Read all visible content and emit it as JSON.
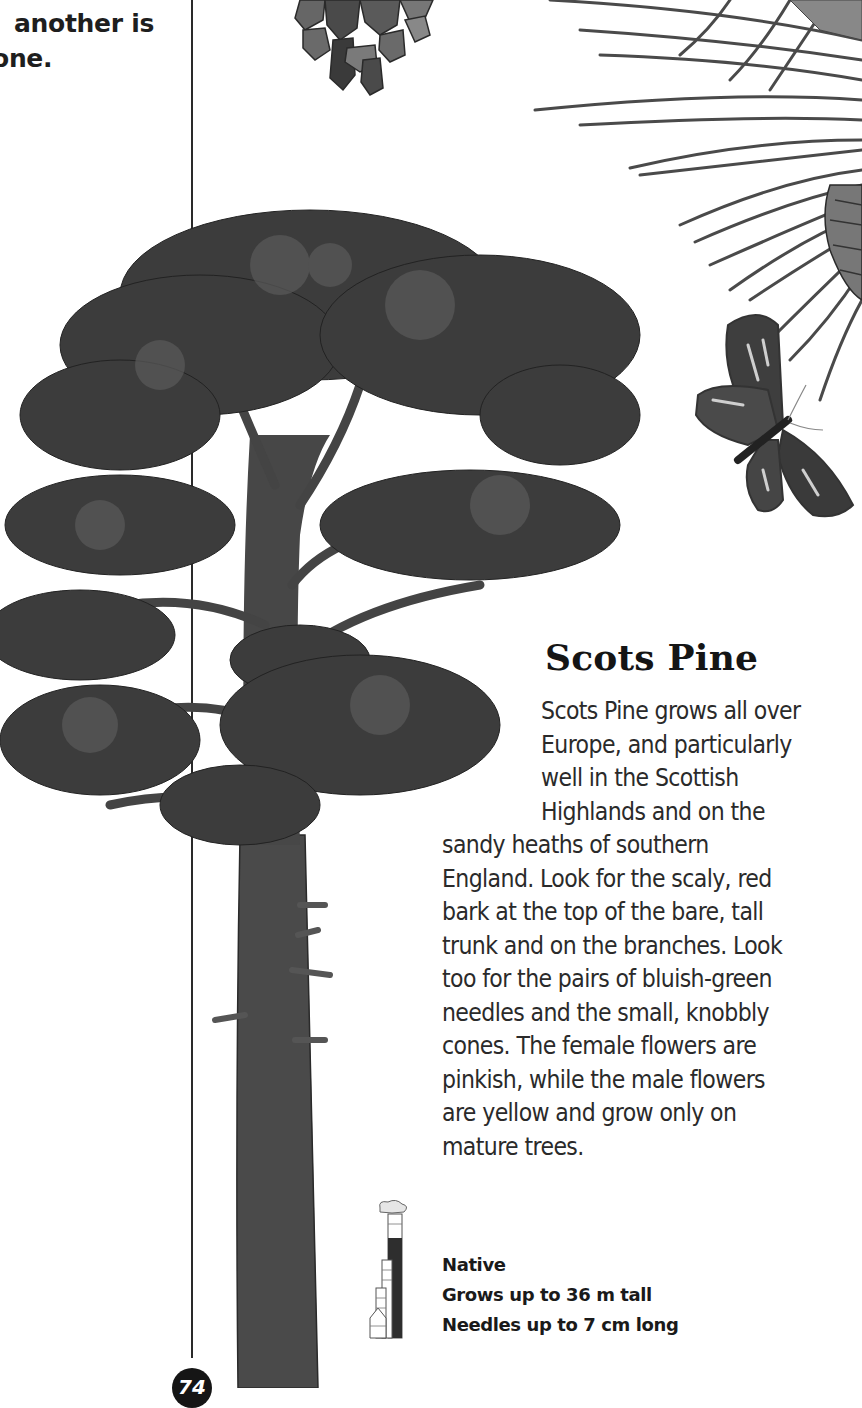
{
  "page": {
    "carried_caption": [
      "another is",
      "one."
    ],
    "title": "Scots Pine",
    "body_wrapped_lines": [
      "Scots Pine grows all over",
      "Europe, and particularly",
      "well in the Scottish",
      "Highlands and on the"
    ],
    "body_full_lines": [
      "sandy heaths of southern",
      "England. Look for the scaly, red",
      "bark at the top of the bare, tall",
      "trunk and on the branches. Look",
      "too for the pairs of bluish-green",
      "needles and the small, knobbly",
      "cones. The female flowers are",
      "pinkish, while the male flowers",
      "are yellow and grow only on",
      "mature trees."
    ],
    "facts": {
      "status": "Native",
      "height": "Grows up to 36 m tall",
      "needles": "Needles up to 7 cm long"
    },
    "page_number": "74",
    "illustrations": {
      "tree": "scots-pine-tree-illustration",
      "cone": "pine-cone-illustration",
      "branch": "pine-needle-branch-illustration",
      "moth": "moth-illustration",
      "height_scale": "building-height-scale-icon"
    },
    "colors": {
      "ink": "#1a1a1a",
      "foliage": "#3a3a3a",
      "bark": "#4a4a4a",
      "paper": "#ffffff"
    }
  }
}
